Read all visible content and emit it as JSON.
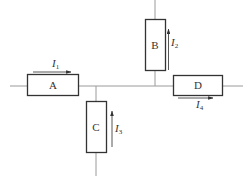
{
  "diagram": {
    "type": "circuit-junction",
    "elements": [
      {
        "id": "A",
        "label": "A",
        "orientation": "horizontal"
      },
      {
        "id": "B",
        "label": "B",
        "orientation": "vertical"
      },
      {
        "id": "C",
        "label": "C",
        "orientation": "vertical"
      },
      {
        "id": "D",
        "label": "D",
        "orientation": "horizontal"
      }
    ],
    "currents": [
      {
        "id": "I1",
        "symbol": "I",
        "sub": "1",
        "element": "A",
        "direction": "right"
      },
      {
        "id": "I2",
        "symbol": "I",
        "sub": "2",
        "element": "B",
        "direction": "up"
      },
      {
        "id": "I3",
        "symbol": "I",
        "sub": "3",
        "element": "C",
        "direction": "up"
      },
      {
        "id": "I4",
        "symbol": "I",
        "sub": "4",
        "element": "D",
        "direction": "right"
      }
    ]
  }
}
